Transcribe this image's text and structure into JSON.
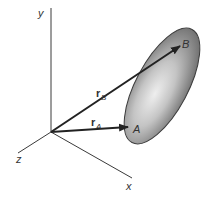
{
  "diagram": {
    "axes": {
      "y_label": "y",
      "x_label": "x",
      "z_label": "z"
    },
    "vectors": {
      "rA": {
        "symbol": "r",
        "subscript": "A",
        "point_label": "A"
      },
      "rB": {
        "symbol": "r",
        "subscript": "B",
        "point_label": "B"
      }
    },
    "colors": {
      "axis": "#3a3a3a",
      "vector": "#222222",
      "body_dark": "#6e6e6e",
      "body_light": "#e6e6e6",
      "body_edge": "#3c3c3c",
      "label": "#333333"
    }
  }
}
